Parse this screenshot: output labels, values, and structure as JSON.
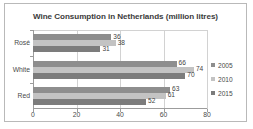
{
  "chart_data": {
    "type": "bar",
    "orientation": "horizontal",
    "title": "Wine Consumption in Netherlands (million litres)",
    "xlabel": "",
    "ylabel": "",
    "categories": [
      "Rosé",
      "White",
      "Red"
    ],
    "series": [
      {
        "name": "2005",
        "values": [
          36,
          66,
          63
        ],
        "color": "#8e8e8e"
      },
      {
        "name": "2010",
        "values": [
          38,
          74,
          61
        ],
        "color": "#c3c3c3"
      },
      {
        "name": "2015",
        "values": [
          31,
          70,
          52
        ],
        "color": "#7c7c7c"
      }
    ],
    "xlim": [
      0,
      80
    ],
    "xticks": [
      0,
      20,
      40,
      60,
      80
    ],
    "xtick_labels": [
      "0",
      "20",
      "40",
      "60",
      "80"
    ],
    "grid": true,
    "grid_axis": "x",
    "legend_position": "right",
    "data_labels": true
  },
  "legend": {
    "items": [
      {
        "label": "2005",
        "color": "#8e8e8e"
      },
      {
        "label": "2010",
        "color": "#c3c3c3"
      },
      {
        "label": "2015",
        "color": "#7c7c7c"
      }
    ]
  }
}
